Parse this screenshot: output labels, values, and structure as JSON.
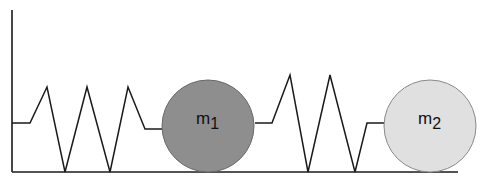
{
  "diagram": {
    "wall": {
      "x": 12,
      "y_top": 10,
      "y_bottom": 172
    },
    "floor": {
      "y": 172,
      "x_start": 12,
      "x_end": 458
    },
    "springs": [
      {
        "name": "spring-1",
        "points": "12,123 30,123 47,87 65,172 87,87 110,172 128,87 145,129 162,129"
      },
      {
        "name": "spring-2",
        "points": "255,123 272,123 290,75 308,172 330,75 355,172 367,123 384,123"
      }
    ],
    "masses": [
      {
        "name": "mass-1",
        "label": "m",
        "subscript": "1",
        "cx": 208,
        "cy": 126,
        "r": 46,
        "fill": "#8e8e8e"
      },
      {
        "name": "mass-2",
        "label": "m",
        "subscript": "2",
        "cx": 430,
        "cy": 126,
        "r": 46,
        "fill": "#e0e0e0"
      }
    ],
    "colors": {
      "line": "#1a1a1a",
      "mass_outline": "#6a6a6a"
    }
  }
}
